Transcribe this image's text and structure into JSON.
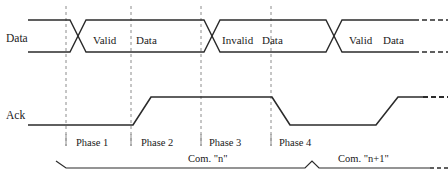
{
  "diagram": {
    "colors": {
      "waveform": "#2b2b2b",
      "gridline": "#8c8c8c",
      "text": "#1a1a1a",
      "background": "#ffffff"
    },
    "signals": [
      {
        "name": "Data",
        "label": "Data",
        "label_x": 6,
        "label_y": 41,
        "high_y": 20,
        "low_y": 52,
        "start_x": 28,
        "end_x": 448,
        "crossings": [
          78,
          212,
          334
        ],
        "dash_start_x": 414
      },
      {
        "name": "Ack",
        "label": "Ack",
        "label_x": 6,
        "label_y": 118,
        "high_y": 97,
        "low_y": 125,
        "start_x": 28,
        "end_x": 448,
        "edges": [
          {
            "type": "rise",
            "from_x": 133,
            "to_x": 151
          },
          {
            "type": "fall",
            "from_x": 272,
            "to_x": 290
          },
          {
            "type": "rise",
            "from_x": 376,
            "to_x": 398
          }
        ],
        "dash_start_x": 423
      }
    ],
    "data_states": [
      {
        "label": "Valid",
        "x": 93,
        "y": 41
      },
      {
        "label": "Data",
        "x": 136,
        "y": 41
      },
      {
        "label": "Invalid",
        "x": 222,
        "y": 41
      },
      {
        "label": "Data",
        "x": 259,
        "y": 41
      },
      {
        "label": "Valid",
        "x": 349,
        "y": 41
      },
      {
        "label": "Data",
        "x": 382,
        "y": 41
      }
    ],
    "gridlines": [
      {
        "x": 66,
        "y1": 6,
        "y2": 146
      },
      {
        "x": 131,
        "y1": 6,
        "y2": 146
      },
      {
        "x": 201,
        "y1": 6,
        "y2": 146
      },
      {
        "x": 271,
        "y1": 6,
        "y2": 146
      }
    ],
    "phases": [
      {
        "label": "Phase 1",
        "x": 80,
        "y": 144
      },
      {
        "label": "Phase 2",
        "x": 144,
        "y": 144
      },
      {
        "label": "Phase 3",
        "x": 211,
        "y": 144
      },
      {
        "label": "Phase 4",
        "x": 281,
        "y": 144
      }
    ],
    "brace": {
      "y_line": 168,
      "y_peak": 161,
      "left_x": 66,
      "left_tip_x": 56,
      "left_tip_y": 161,
      "peak_x": 312,
      "right_x": 430,
      "dash_start_x": 430,
      "dash_end_x": 448,
      "segments": [
        {
          "label": "Com. \"n\"",
          "x": 202,
          "y": 160
        },
        {
          "label": "Com. \"n+1\"",
          "x": 356,
          "y": 160
        }
      ]
    }
  }
}
